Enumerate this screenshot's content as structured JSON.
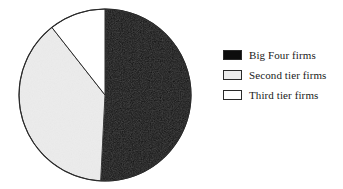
{
  "chart_data": {
    "type": "pie",
    "title": "",
    "categories": [
      "Big Four firms",
      "Second tier firms",
      "Third tier firms"
    ],
    "values": [
      50.8,
      38.6,
      10.6
    ],
    "units": "percent",
    "start_angle_deg": 0,
    "direction": "clockwise",
    "slice_angles_deg": [
      183,
      139,
      38
    ],
    "colors": [
      "#0d0d0d",
      "#ececec",
      "#ffffff"
    ],
    "edge_color": "#2a2a2a",
    "legend": {
      "position": "right",
      "entries": [
        {
          "label": "Big Four firms",
          "color": "#0d0d0d"
        },
        {
          "label": "Second tier firms",
          "color": "#ececec"
        },
        {
          "label": "Third tier firms",
          "color": "#ffffff"
        }
      ]
    },
    "grid": false,
    "xlabel": "",
    "ylabel": ""
  },
  "pie": {
    "center_x": 88,
    "center_y": 89,
    "radius": 86,
    "slices": [
      {
        "name": "big-four-firms",
        "path": "M 88 89 L 88 3 A 86 86 0 0 1 83.5 174.9 Z",
        "fill": "#0d0d0d"
      },
      {
        "name": "second-tier-firms",
        "path": "M 88 89 L 83.5 174.9 A 86 86 0 0 1 35 22.5 Z",
        "fill": "#ececec"
      },
      {
        "name": "third-tier-firms",
        "path": "M 88 89 L 35 22.5 A 86 86 0 0 1 88 3 Z",
        "fill": "#ffffff"
      }
    ]
  },
  "figure": {
    "background": "#ffffff"
  }
}
